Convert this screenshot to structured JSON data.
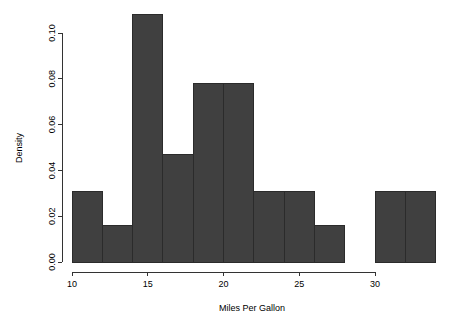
{
  "chart_data": {
    "type": "bar",
    "title": "",
    "subtitle": "",
    "xlabel": "Miles Per Gallon",
    "ylabel": "Density",
    "grid": false,
    "legend": false,
    "legend_position": "none",
    "bar_color": "#404040",
    "bar_border_color": "#2b2b2b",
    "axis_color": "#333333",
    "background_color": "#ffffff",
    "xlim": [
      10,
      34
    ],
    "ylim": [
      0.0,
      0.11
    ],
    "xticks": [
      10,
      15,
      20,
      25,
      30
    ],
    "xtick_labels": [
      "10",
      "15",
      "20",
      "25",
      "30"
    ],
    "yticks": [
      0.0,
      0.02,
      0.04,
      0.06,
      0.08,
      0.1
    ],
    "ytick_labels": [
      "0.00",
      "0.02",
      "0.04",
      "0.06",
      "0.08",
      "0.10"
    ],
    "bin_width": 2,
    "bin_edges": [
      10,
      12,
      14,
      16,
      18,
      20,
      22,
      24,
      26,
      28,
      30,
      32,
      34
    ],
    "categories": [
      "10-12",
      "12-14",
      "14-16",
      "16-18",
      "18-20",
      "20-22",
      "22-24",
      "24-26",
      "26-28",
      "28-30",
      "30-32",
      "32-34"
    ],
    "values": [
      0.031,
      0.016,
      0.108,
      0.047,
      0.078,
      0.078,
      0.031,
      0.031,
      0.016,
      0.0,
      0.031,
      0.031
    ]
  }
}
